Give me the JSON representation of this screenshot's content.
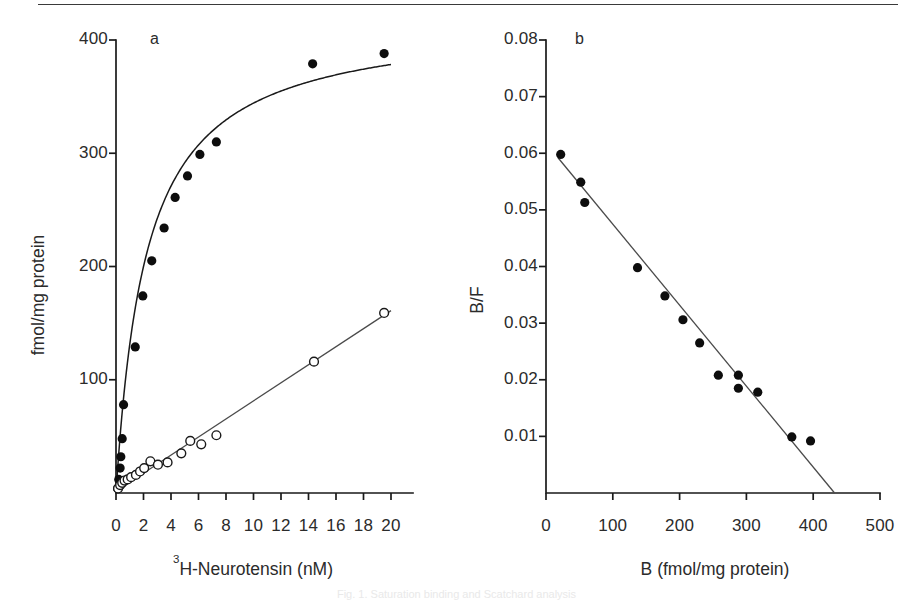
{
  "figure": {
    "top_rule": true,
    "background": "#ffffff",
    "ink": "#1a1a1a",
    "caption_faint": "Fig. 1. Saturation binding and Scatchard analysis"
  },
  "chart_data": [
    {
      "id": "panel-a",
      "type": "scatter",
      "panel_letter": "a",
      "title": "",
      "xlabel": "3H-Neurotensin (nM)",
      "xlabel_sup": "3",
      "xlabel_rest": "H-Neurotensin (nM)",
      "ylabel": "fmol/mg protein",
      "xlim": [
        0,
        21.5
      ],
      "ylim": [
        0,
        415
      ],
      "xticks": [
        0,
        2,
        4,
        6,
        8,
        10,
        12,
        14,
        16,
        18,
        20
      ],
      "xticklabels": [
        "0",
        "2",
        "4",
        "6",
        "8",
        "10",
        "12",
        "14",
        "16",
        "18",
        "20"
      ],
      "yticks": [
        100,
        200,
        300,
        400
      ],
      "yticklabels": [
        "100",
        "200",
        "300",
        "400"
      ],
      "grid": false,
      "legend": "none",
      "series": [
        {
          "name": "total-binding-filled",
          "marker": "filled-circle",
          "values": [
            {
              "x": 0.12,
              "y": 4
            },
            {
              "x": 0.2,
              "y": 12
            },
            {
              "x": 0.3,
              "y": 22
            },
            {
              "x": 0.35,
              "y": 32
            },
            {
              "x": 0.45,
              "y": 48
            },
            {
              "x": 0.55,
              "y": 78
            },
            {
              "x": 1.4,
              "y": 129
            },
            {
              "x": 1.95,
              "y": 174
            },
            {
              "x": 2.6,
              "y": 205
            },
            {
              "x": 3.5,
              "y": 234
            },
            {
              "x": 4.3,
              "y": 261
            },
            {
              "x": 5.2,
              "y": 280
            },
            {
              "x": 6.1,
              "y": 299
            },
            {
              "x": 7.3,
              "y": 310
            },
            {
              "x": 14.3,
              "y": 379
            },
            {
              "x": 19.5,
              "y": 388
            }
          ],
          "fit": {
            "kind": "hyperbola",
            "bmax": 420,
            "kd": 2.2,
            "note": "saturable curve through filled points"
          }
        },
        {
          "name": "nonspecific-binding-open",
          "marker": "open-circle",
          "values": [
            {
              "x": 0.15,
              "y": 4
            },
            {
              "x": 0.3,
              "y": 7
            },
            {
              "x": 0.45,
              "y": 9
            },
            {
              "x": 0.62,
              "y": 11
            },
            {
              "x": 0.85,
              "y": 12
            },
            {
              "x": 1.1,
              "y": 14
            },
            {
              "x": 1.45,
              "y": 16
            },
            {
              "x": 1.75,
              "y": 19
            },
            {
              "x": 2.05,
              "y": 22
            },
            {
              "x": 2.5,
              "y": 28
            },
            {
              "x": 3.05,
              "y": 25
            },
            {
              "x": 3.75,
              "y": 27
            },
            {
              "x": 4.75,
              "y": 35
            },
            {
              "x": 5.4,
              "y": 46
            },
            {
              "x": 6.2,
              "y": 43
            },
            {
              "x": 7.3,
              "y": 51
            },
            {
              "x": 14.4,
              "y": 116
            },
            {
              "x": 19.5,
              "y": 159
            }
          ],
          "fit": {
            "kind": "line",
            "x0": 0.3,
            "y0": 4,
            "x1": 20.0,
            "y1": 161,
            "note": "linear non-specific binding"
          }
        }
      ]
    },
    {
      "id": "panel-b",
      "type": "scatter",
      "panel_letter": "b",
      "title": "",
      "xlabel": "B (fmol/mg protein)",
      "ylabel": "B/F",
      "xlim": [
        0,
        530
      ],
      "ylim": [
        0,
        0.0845
      ],
      "xticks": [
        0,
        100,
        200,
        300,
        400,
        500
      ],
      "xticklabels": [
        "0",
        "100",
        "200",
        "300",
        "400",
        "500"
      ],
      "yticks": [
        0.01,
        0.02,
        0.03,
        0.04,
        0.05,
        0.06,
        0.07,
        0.08
      ],
      "yticklabels": [
        "0.01",
        "0.02",
        "0.03",
        "0.04",
        "0.05",
        "0.06",
        "0.07",
        "0.08"
      ],
      "grid": false,
      "legend": "none",
      "series": [
        {
          "name": "scatchard-points",
          "marker": "filled-circle",
          "values": [
            {
              "x": 22,
              "y": 0.0598
            },
            {
              "x": 52,
              "y": 0.0549
            },
            {
              "x": 58,
              "y": 0.0513
            },
            {
              "x": 137,
              "y": 0.0398
            },
            {
              "x": 178,
              "y": 0.0348
            },
            {
              "x": 205,
              "y": 0.0306
            },
            {
              "x": 230,
              "y": 0.0265
            },
            {
              "x": 258,
              "y": 0.0208
            },
            {
              "x": 288,
              "y": 0.0208
            },
            {
              "x": 288,
              "y": 0.0185
            },
            {
              "x": 317,
              "y": 0.0178
            },
            {
              "x": 368,
              "y": 0.0099
            },
            {
              "x": 396,
              "y": 0.0092
            }
          ],
          "fit": {
            "kind": "line",
            "x0": 18,
            "y0": 0.0592,
            "x1": 432,
            "y1": 0.0,
            "note": "Scatchard regression line, x-intercept ~432"
          }
        }
      ]
    }
  ]
}
